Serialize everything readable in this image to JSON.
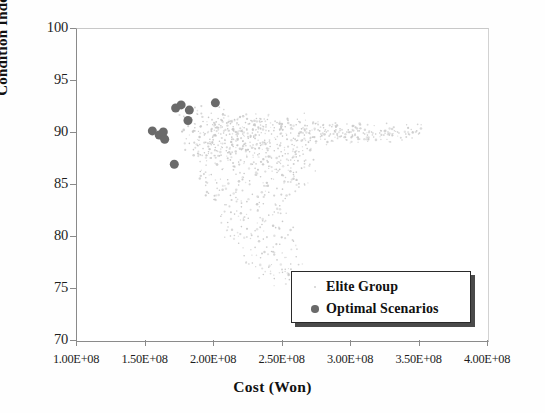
{
  "chart_data": {
    "type": "scatter",
    "title": "",
    "xlabel": "Cost (Won)",
    "ylabel": "Condition Index",
    "xlim": [
      100000000,
      400000000
    ],
    "ylim": [
      70,
      100
    ],
    "xticks": [
      100000000,
      150000000,
      200000000,
      250000000,
      300000000,
      350000000,
      400000000
    ],
    "xticklabels": [
      "1.00E+08",
      "1.50E+08",
      "2.00E+08",
      "2.50E+08",
      "3.00E+08",
      "3.50E+08",
      "4.00E+08"
    ],
    "yticks": [
      70,
      75,
      80,
      85,
      90,
      95,
      100
    ],
    "yticklabels": [
      "70",
      "75",
      "80",
      "85",
      "90",
      "95",
      "100"
    ],
    "grid": false,
    "legend_position": "lower right",
    "series": [
      {
        "name": "Elite Group",
        "marker": "dot-tiny",
        "color": "#c9c9c9",
        "marker_size": 1.6,
        "points": [
          [
            178000000,
            91.6
          ],
          [
            181000000,
            90.9
          ],
          [
            184000000,
            91.3
          ],
          [
            186000000,
            90.2
          ],
          [
            188000000,
            91.8
          ],
          [
            190000000,
            90.6
          ],
          [
            192000000,
            91.1
          ],
          [
            193000000,
            89.9
          ],
          [
            195000000,
            90.8
          ],
          [
            196000000,
            91.5
          ],
          [
            198000000,
            90.3
          ],
          [
            199000000,
            89.6
          ],
          [
            200000000,
            91.0
          ],
          [
            201000000,
            90.5
          ],
          [
            203000000,
            91.4
          ],
          [
            204000000,
            89.2
          ],
          [
            205000000,
            90.7
          ],
          [
            206000000,
            91.2
          ],
          [
            207000000,
            90.0
          ],
          [
            208000000,
            91.7
          ],
          [
            209000000,
            89.8
          ],
          [
            210000000,
            90.4
          ],
          [
            211000000,
            91.1
          ],
          [
            212000000,
            90.9
          ],
          [
            213000000,
            89.4
          ],
          [
            214000000,
            90.6
          ],
          [
            215000000,
            91.3
          ],
          [
            216000000,
            90.1
          ],
          [
            217000000,
            89.7
          ],
          [
            218000000,
            90.8
          ],
          [
            219000000,
            91.5
          ],
          [
            220000000,
            90.2
          ],
          [
            221000000,
            89.9
          ],
          [
            222000000,
            90.5
          ],
          [
            223000000,
            91.0
          ],
          [
            224000000,
            90.3
          ],
          [
            225000000,
            89.5
          ],
          [
            226000000,
            90.9
          ],
          [
            227000000,
            91.2
          ],
          [
            228000000,
            90.0
          ],
          [
            229000000,
            89.6
          ],
          [
            230000000,
            90.7
          ],
          [
            231000000,
            91.4
          ],
          [
            232000000,
            90.1
          ],
          [
            233000000,
            89.8
          ],
          [
            234000000,
            90.4
          ],
          [
            235000000,
            91.1
          ],
          [
            236000000,
            90.6
          ],
          [
            237000000,
            89.3
          ],
          [
            238000000,
            90.8
          ],
          [
            239000000,
            91.3
          ],
          [
            240000000,
            90.2
          ],
          [
            242000000,
            89.9
          ],
          [
            244000000,
            90.5
          ],
          [
            246000000,
            91.0
          ],
          [
            248000000,
            90.3
          ],
          [
            250000000,
            89.7
          ],
          [
            252000000,
            90.6
          ],
          [
            254000000,
            91.2
          ],
          [
            256000000,
            90.0
          ],
          [
            258000000,
            89.5
          ],
          [
            260000000,
            90.8
          ],
          [
            262000000,
            91.1
          ],
          [
            264000000,
            90.4
          ],
          [
            266000000,
            89.8
          ],
          [
            268000000,
            90.7
          ],
          [
            270000000,
            90.2
          ],
          [
            272000000,
            89.6
          ],
          [
            274000000,
            90.9
          ],
          [
            276000000,
            90.3
          ],
          [
            278000000,
            89.9
          ],
          [
            280000000,
            90.5
          ],
          [
            282000000,
            90.1
          ],
          [
            284000000,
            89.7
          ],
          [
            286000000,
            90.6
          ],
          [
            288000000,
            90.2
          ],
          [
            290000000,
            89.8
          ],
          [
            292000000,
            90.4
          ],
          [
            294000000,
            90.0
          ],
          [
            296000000,
            89.6
          ],
          [
            298000000,
            90.3
          ],
          [
            300000000,
            90.1
          ],
          [
            303000000,
            89.9
          ],
          [
            306000000,
            90.2
          ],
          [
            309000000,
            90.0
          ],
          [
            312000000,
            89.8
          ],
          [
            315000000,
            90.1
          ],
          [
            318000000,
            89.9
          ],
          [
            321000000,
            90.0
          ],
          [
            324000000,
            89.8
          ],
          [
            327000000,
            90.1
          ],
          [
            330000000,
            89.9
          ],
          [
            335000000,
            90.0
          ],
          [
            340000000,
            89.9
          ],
          [
            345000000,
            90.1
          ],
          [
            350000000,
            90.0
          ],
          [
            182000000,
            89.0
          ],
          [
            185000000,
            88.4
          ],
          [
            188000000,
            88.8
          ],
          [
            190000000,
            87.9
          ],
          [
            192000000,
            88.5
          ],
          [
            194000000,
            89.1
          ],
          [
            196000000,
            88.2
          ],
          [
            198000000,
            87.6
          ],
          [
            200000000,
            88.9
          ],
          [
            202000000,
            88.3
          ],
          [
            204000000,
            87.8
          ],
          [
            206000000,
            88.6
          ],
          [
            208000000,
            89.0
          ],
          [
            210000000,
            88.1
          ],
          [
            212000000,
            87.4
          ],
          [
            214000000,
            88.7
          ],
          [
            216000000,
            88.0
          ],
          [
            218000000,
            87.2
          ],
          [
            220000000,
            88.4
          ],
          [
            222000000,
            88.9
          ],
          [
            224000000,
            87.7
          ],
          [
            226000000,
            88.2
          ],
          [
            228000000,
            87.0
          ],
          [
            230000000,
            88.5
          ],
          [
            232000000,
            87.9
          ],
          [
            234000000,
            88.8
          ],
          [
            236000000,
            87.5
          ],
          [
            238000000,
            88.1
          ],
          [
            240000000,
            86.8
          ],
          [
            242000000,
            87.6
          ],
          [
            244000000,
            88.3
          ],
          [
            246000000,
            87.1
          ],
          [
            248000000,
            86.5
          ],
          [
            250000000,
            87.8
          ],
          [
            252000000,
            88.0
          ],
          [
            254000000,
            86.9
          ],
          [
            256000000,
            87.4
          ],
          [
            258000000,
            86.2
          ],
          [
            260000000,
            87.7
          ],
          [
            262000000,
            88.2
          ],
          [
            264000000,
            86.6
          ],
          [
            266000000,
            87.3
          ],
          [
            268000000,
            88.5
          ],
          [
            270000000,
            87.0
          ],
          [
            190000000,
            86.3
          ],
          [
            194000000,
            85.7
          ],
          [
            198000000,
            86.0
          ],
          [
            202000000,
            85.2
          ],
          [
            206000000,
            86.5
          ],
          [
            210000000,
            85.5
          ],
          [
            214000000,
            86.8
          ],
          [
            218000000,
            85.0
          ],
          [
            222000000,
            86.1
          ],
          [
            226000000,
            85.4
          ],
          [
            230000000,
            86.6
          ],
          [
            234000000,
            85.8
          ],
          [
            238000000,
            84.9
          ],
          [
            242000000,
            85.6
          ],
          [
            246000000,
            86.2
          ],
          [
            250000000,
            84.6
          ],
          [
            254000000,
            85.3
          ],
          [
            258000000,
            86.0
          ],
          [
            262000000,
            84.8
          ],
          [
            266000000,
            85.1
          ],
          [
            196000000,
            84.2
          ],
          [
            200000000,
            83.6
          ],
          [
            204000000,
            84.5
          ],
          [
            208000000,
            83.1
          ],
          [
            212000000,
            84.0
          ],
          [
            216000000,
            83.8
          ],
          [
            220000000,
            82.9
          ],
          [
            224000000,
            83.4
          ],
          [
            228000000,
            84.1
          ],
          [
            232000000,
            82.6
          ],
          [
            236000000,
            83.2
          ],
          [
            240000000,
            84.3
          ],
          [
            244000000,
            82.4
          ],
          [
            248000000,
            83.0
          ],
          [
            252000000,
            83.7
          ],
          [
            205000000,
            82.0
          ],
          [
            210000000,
            81.4
          ],
          [
            215000000,
            82.2
          ],
          [
            220000000,
            81.0
          ],
          [
            225000000,
            81.8
          ],
          [
            230000000,
            80.6
          ],
          [
            235000000,
            81.2
          ],
          [
            240000000,
            82.1
          ],
          [
            245000000,
            80.9
          ],
          [
            250000000,
            81.5
          ],
          [
            212000000,
            80.1
          ],
          [
            218000000,
            79.4
          ],
          [
            224000000,
            80.0
          ],
          [
            230000000,
            79.0
          ],
          [
            236000000,
            79.8
          ],
          [
            242000000,
            78.6
          ],
          [
            248000000,
            79.3
          ],
          [
            254000000,
            80.2
          ],
          [
            258000000,
            79.6
          ],
          [
            222000000,
            78.2
          ],
          [
            228000000,
            77.5
          ],
          [
            234000000,
            78.0
          ],
          [
            240000000,
            77.1
          ],
          [
            246000000,
            77.8
          ],
          [
            252000000,
            76.9
          ],
          [
            256000000,
            77.4
          ],
          [
            260000000,
            78.1
          ],
          [
            236000000,
            76.4
          ],
          [
            244000000,
            76.0
          ],
          [
            250000000,
            76.6
          ],
          [
            255000000,
            75.9
          ],
          [
            186000000,
            90.5
          ],
          [
            189000000,
            89.3
          ],
          [
            193000000,
            88.1
          ],
          [
            197000000,
            89.4
          ],
          [
            201000000,
            88.6
          ],
          [
            205000000,
            89.9
          ],
          [
            209000000,
            88.3
          ],
          [
            213000000,
            89.6
          ],
          [
            217000000,
            88.8
          ],
          [
            221000000,
            89.2
          ],
          [
            225000000,
            88.4
          ],
          [
            229000000,
            89.7
          ],
          [
            233000000,
            88.0
          ],
          [
            237000000,
            89.1
          ],
          [
            241000000,
            88.7
          ],
          [
            245000000,
            89.4
          ],
          [
            249000000,
            88.2
          ],
          [
            253000000,
            89.8
          ],
          [
            257000000,
            88.9
          ],
          [
            261000000,
            89.3
          ],
          [
            265000000,
            90.0
          ],
          [
            269000000,
            89.1
          ],
          [
            273000000,
            89.6
          ],
          [
            277000000,
            90.2
          ],
          [
            281000000,
            89.4
          ],
          [
            285000000,
            89.9
          ],
          [
            289000000,
            90.3
          ],
          [
            293000000,
            89.7
          ],
          [
            297000000,
            90.1
          ],
          [
            301000000,
            89.8
          ],
          [
            305000000,
            90.2
          ],
          [
            310000000,
            89.9
          ],
          [
            316000000,
            90.0
          ],
          [
            322000000,
            90.2
          ],
          [
            328000000,
            89.8
          ],
          [
            334000000,
            90.1
          ],
          [
            342000000,
            89.9
          ],
          [
            348000000,
            90.2
          ]
        ]
      },
      {
        "name": "Optimal Scenarios",
        "marker": "circle",
        "color": "#6a6a6a",
        "marker_size": 9,
        "points": [
          [
            155000000,
            90.2
          ],
          [
            160000000,
            89.8
          ],
          [
            163000000,
            90.1
          ],
          [
            164000000,
            89.4
          ],
          [
            172000000,
            92.4
          ],
          [
            176000000,
            92.7
          ],
          [
            182000000,
            92.2
          ],
          [
            181000000,
            91.2
          ],
          [
            171000000,
            87.0
          ],
          [
            201000000,
            92.9
          ]
        ]
      }
    ]
  },
  "legend": {
    "entries": [
      {
        "label": "Elite Group",
        "marker": "tiny-dot-marker"
      },
      {
        "label": "Optimal Scenarios",
        "marker": "large-dot-marker"
      }
    ]
  },
  "colors": {
    "axis": "#8a8a8a",
    "text": "#111111",
    "elite_group": "#c9c9c9",
    "optimal_scenarios": "#6a6a6a",
    "legend_border": "#2a2a2a",
    "legend_shadow": "#4a4a4a"
  }
}
